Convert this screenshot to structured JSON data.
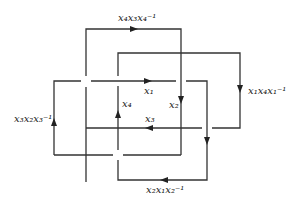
{
  "diagram": {
    "type": "braid-loop relation diagram",
    "stroke_color": "#333333",
    "labels": {
      "top": "x₄x₃x₄⁻¹",
      "right": "x₁x₄x₁⁻¹",
      "left": "x₃x₂x₃⁻¹",
      "bottom": "x₂x₁x₂⁻¹",
      "x1": "x₁",
      "x2": "x₂",
      "x3": "x₃",
      "x4": "x₄"
    }
  }
}
